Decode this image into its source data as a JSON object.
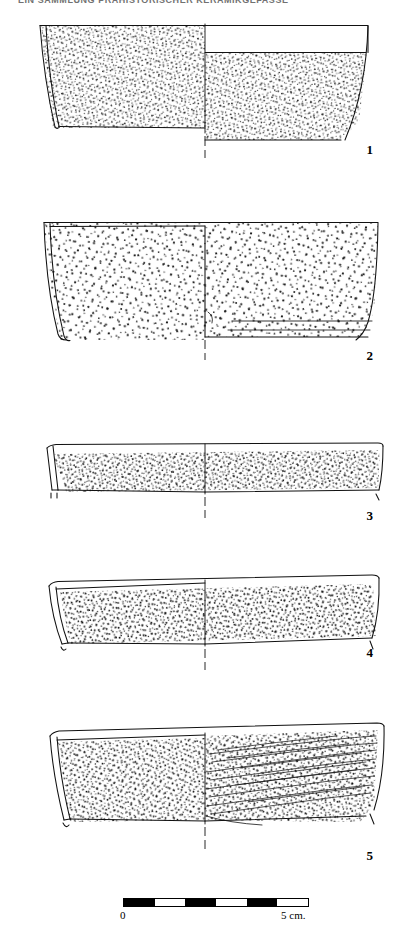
{
  "plate": {
    "kind": "archaeological-pottery-profile-plate",
    "header_text": "EIN SAMMLUNG PRAHISTORISCHER KERAMIKGEFASSE",
    "header_visible": "partially-cropped",
    "background_color": "#ffffff",
    "ink_color": "#111111",
    "figure_count": 5
  },
  "figures": [
    {
      "number": "1",
      "caption_number": "1",
      "description": "Large open bowl / basin rim-to-wall profile, reconstructed half section. Left half stippled exterior surface, right half shows plain rim band over stippled body.",
      "num_x": 333,
      "num_y": 142,
      "box": {
        "x": 28,
        "y": 18,
        "w": 356,
        "h": 140
      }
    },
    {
      "number": "2",
      "caption_number": "2",
      "description": "Wide shallow vessel with coarse sparse stipple, flat base indicated on right half by horizontal base lines.",
      "num_x": 333,
      "num_y": 348,
      "box": {
        "x": 18,
        "y": 208,
        "w": 366,
        "h": 150
      }
    },
    {
      "number": "3",
      "caption_number": "3",
      "description": "Very shallow wide dish, dense fine stipple band across middle of the wall.",
      "num_x": 333,
      "num_y": 508,
      "box": {
        "x": 18,
        "y": 428,
        "w": 366,
        "h": 88
      }
    },
    {
      "number": "4",
      "caption_number": "4",
      "description": "Shallow wide dish similar to figure 3 but with slightly deeper wall and heavier stipple.",
      "num_x": 333,
      "num_y": 645,
      "box": {
        "x": 18,
        "y": 556,
        "w": 366,
        "h": 95
      }
    },
    {
      "number": "5",
      "caption_number": "5",
      "description": "Wide dish with stippled left half and right half bearing long diagonal wiped striations sloping up to the right.",
      "num_x": 333,
      "num_y": 848,
      "box": {
        "x": 18,
        "y": 700,
        "w": 366,
        "h": 130
      }
    }
  ],
  "scale_bar": {
    "label_left": "0",
    "label_right": "5 cm.",
    "segments": 6,
    "segment_pattern": [
      "on",
      "off",
      "on",
      "off",
      "on",
      "off"
    ],
    "length_px": 186,
    "represents": "5 cm",
    "color_on": "#000000",
    "color_off": "#ffffff"
  }
}
